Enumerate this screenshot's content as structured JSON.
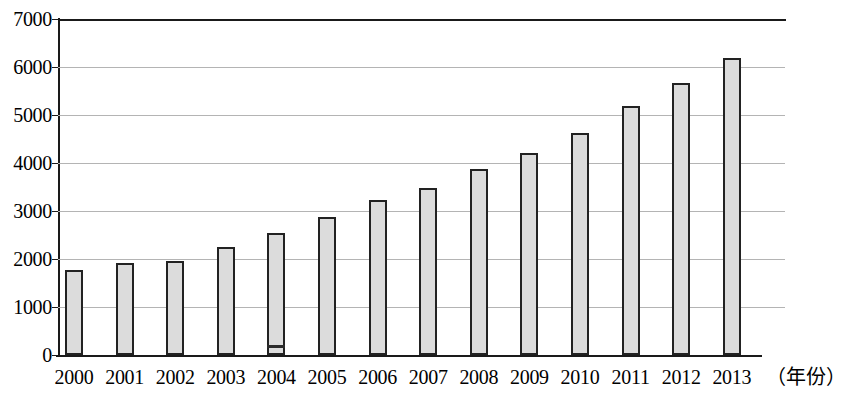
{
  "chart_data": {
    "type": "bar",
    "title": "",
    "subtitle": "",
    "xlabel": "（年份）",
    "ylabel": "",
    "categories": [
      "2000",
      "2001",
      "2002",
      "2003",
      "2004",
      "2005",
      "2006",
      "2007",
      "2008",
      "2009",
      "2010",
      "2011",
      "2012",
      "2013"
    ],
    "values": [
      1780,
      1920,
      1950,
      2250,
      2540,
      2870,
      3220,
      3470,
      3880,
      4200,
      4630,
      5190,
      5660,
      6180
    ],
    "series": [
      {
        "name": "",
        "values": [
          1780,
          1920,
          1950,
          2250,
          2540,
          2870,
          3220,
          3470,
          3880,
          4200,
          4630,
          5190,
          5660,
          6180
        ]
      }
    ],
    "ylim": [
      0,
      7000
    ],
    "ytick_labels": [
      "0",
      "1000",
      "2000",
      "3000",
      "4000",
      "5000",
      "6000",
      "7000"
    ],
    "ytick_values": [
      0,
      1000,
      2000,
      3000,
      4000,
      5000,
      6000,
      7000
    ],
    "grid": "horizontal",
    "legend": "none",
    "annotations": [],
    "bar_fill_color": "#dcdcdc",
    "bar_border_color": "#222222",
    "gridline_color": "#b4b4b4",
    "axis_color": "#1a1a1a"
  }
}
